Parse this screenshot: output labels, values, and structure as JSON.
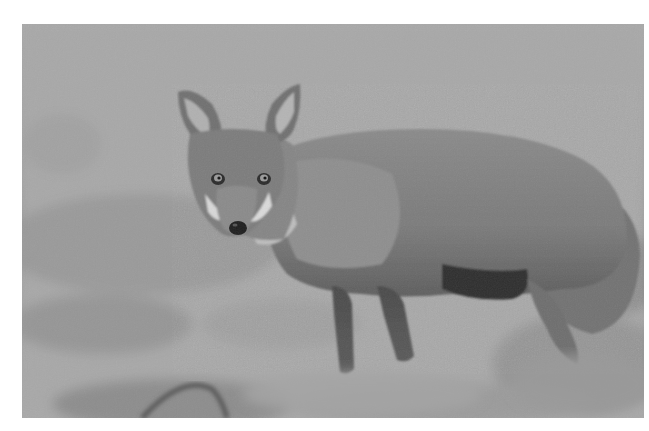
{
  "image": {
    "subject": "red fox standing in grass",
    "alt": "Black-and-white photograph of a fox standing in a grassy field, looking toward the camera",
    "tone": "grayscale",
    "colors": {
      "page_background": "#ffffff",
      "sky_background": "#a9a9a9",
      "grass_mid": "#9c9c9c",
      "fur_body": "#7f7f7f",
      "fur_dark": "#3a3a3a",
      "fur_light": "#d8d8d8"
    }
  }
}
